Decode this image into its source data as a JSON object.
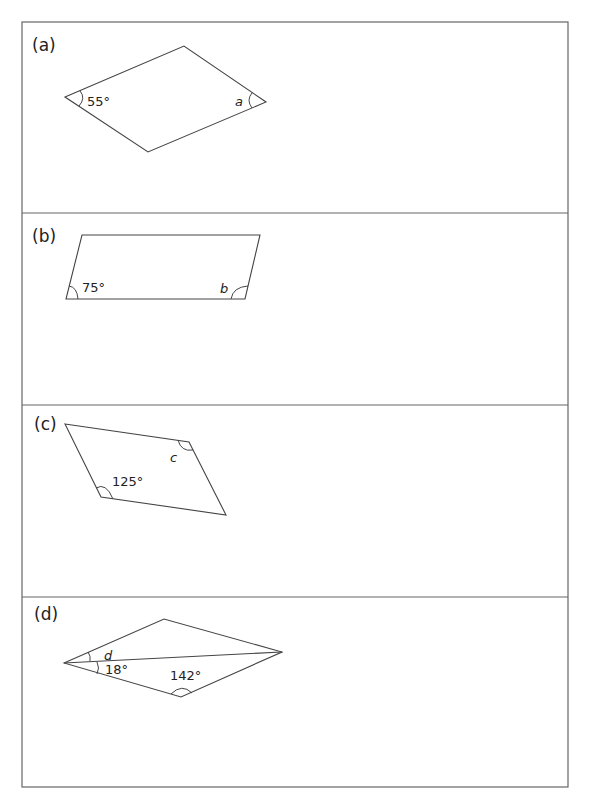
{
  "worksheet": {
    "colors": {
      "line": "#444444",
      "frame": "#666666",
      "background": "#ffffff"
    },
    "panels": [
      {
        "label": "(a)",
        "shape": "parallelogram",
        "vertices": [
          [
            65,
            97
          ],
          [
            184,
            46
          ],
          [
            266,
            102
          ],
          [
            148,
            152
          ]
        ],
        "given_angle": "55°",
        "unknown": "a"
      },
      {
        "label": "(b)",
        "shape": "parallelogram",
        "vertices": [
          [
            82,
            235
          ],
          [
            260,
            235
          ],
          [
            245,
            299
          ],
          [
            66,
            299
          ]
        ],
        "given_angle": "75°",
        "unknown": "b"
      },
      {
        "label": "(c)",
        "shape": "parallelogram",
        "vertices": [
          [
            65,
            424
          ],
          [
            189,
            442
          ],
          [
            226,
            515
          ],
          [
            101,
            497
          ]
        ],
        "given_angle": "125°",
        "unknown": "c"
      },
      {
        "label": "(d)",
        "shape": "parallelogram with diagonal",
        "vertices": [
          [
            64,
            663
          ],
          [
            164,
            619
          ],
          [
            282,
            652
          ],
          [
            181,
            697
          ]
        ],
        "given_angles": [
          "18°",
          "142°"
        ],
        "unknown": "d"
      }
    ]
  }
}
